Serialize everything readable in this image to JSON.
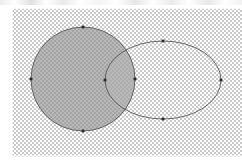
{
  "app": {
    "surface": "vector-editor-canvas",
    "background_mode": "transparency-checkerboard"
  },
  "canvas": {
    "width": 242,
    "height": 167,
    "artboard": {
      "x": 12,
      "y": 8,
      "width": 230,
      "height": 149
    },
    "checker": {
      "tile_size_px": 2,
      "light_color": "#ffffff",
      "dark_color": "#c9c9c9"
    },
    "page_margin_color": "#ffffff"
  },
  "style": {
    "fill_color": "#8e8e8e",
    "fill_opacity": 0.62,
    "stroke_color": "#4a4a4a",
    "stroke_width": 0.8,
    "anchor_color": "#2b2b2b"
  },
  "shapes": [
    {
      "id": "circle-left",
      "name": "circle",
      "type": "circle",
      "cx": 83,
      "cy": 79,
      "r": 52,
      "filled": true,
      "stroked": true,
      "fill_color": "#8e8e8e",
      "stroke_color": "#4a4a4a"
    },
    {
      "id": "ellipse-right",
      "name": "ellipse",
      "type": "ellipse",
      "cx": 163,
      "cy": 80,
      "rx": 58,
      "ry": 39,
      "filled": false,
      "stroked": true,
      "fill_color": "none",
      "stroke_color": "#4a4a4a"
    }
  ],
  "overlap": {
    "name": "intersection-lens",
    "description": "lens-shaped region where circle and ellipse overlap",
    "fill_color": "#9a9a9a",
    "fill_opacity": 0.3
  },
  "anchors": [
    {
      "id": "a1",
      "shape": "circle-left",
      "label": "circle-top",
      "x": 83,
      "y": 27
    },
    {
      "id": "a2",
      "shape": "circle-left",
      "label": "circle-bottom",
      "x": 83,
      "y": 131
    },
    {
      "id": "a3",
      "shape": "circle-left",
      "label": "circle-left",
      "x": 31,
      "y": 79
    },
    {
      "id": "a4",
      "shape": "circle-left",
      "label": "circle-right",
      "x": 135,
      "y": 79
    },
    {
      "id": "a5",
      "shape": "ellipse-right",
      "label": "ellipse-top",
      "x": 163,
      "y": 41
    },
    {
      "id": "a6",
      "shape": "ellipse-right",
      "label": "ellipse-right",
      "x": 221,
      "y": 80
    },
    {
      "id": "a7",
      "shape": "ellipse-right",
      "label": "ellipse-bottom",
      "x": 163,
      "y": 119
    },
    {
      "id": "a8",
      "shape": "ellipse-right",
      "label": "ellipse-left",
      "x": 105,
      "y": 80
    }
  ]
}
